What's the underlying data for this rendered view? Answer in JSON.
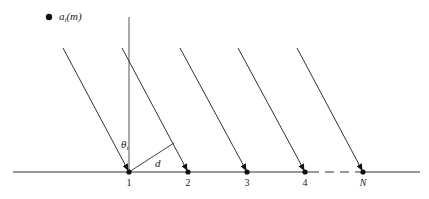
{
  "legend": {
    "marker": "filled-circle",
    "symbol": "a",
    "subscript": "i",
    "argument": "(m)"
  },
  "angle_label": {
    "symbol": "θ",
    "subscript": "i"
  },
  "spacing_label": "d",
  "elements": [
    {
      "label": "1",
      "x": 129
    },
    {
      "label": "2",
      "x": 188
    },
    {
      "label": "3",
      "x": 247
    },
    {
      "label": "4",
      "x": 305
    },
    {
      "label": "N",
      "x": 363,
      "italic": true
    }
  ],
  "baseline": {
    "y": 172,
    "x_start": 13,
    "x_end": 420,
    "dashed_from": 310,
    "dashed_to": 357
  },
  "colors": {
    "line": "#333333",
    "marker": "#111111",
    "normal": "#555555"
  }
}
